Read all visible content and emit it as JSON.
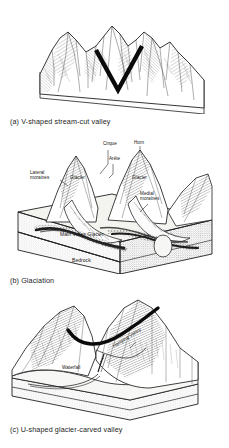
{
  "figure": {
    "background_color": "#ffffff",
    "ink_color": "#1a1a1a"
  },
  "panels": [
    {
      "id": "a",
      "caption": "(a) V-shaped stream-cut valley",
      "labels": []
    },
    {
      "id": "b",
      "caption": "(b) Glaciation",
      "labels": [
        {
          "name": "cirque",
          "text": "Cirque"
        },
        {
          "name": "horn",
          "text": "Horn"
        },
        {
          "name": "arete",
          "text": "Arête"
        },
        {
          "name": "lateral-moraines",
          "text": "Lateral moraines"
        },
        {
          "name": "glacier-left",
          "text": "Glacier"
        },
        {
          "name": "glacier-right",
          "text": "Glacier"
        },
        {
          "name": "medial-moraines",
          "text": "Medial moraines"
        },
        {
          "name": "main-valley-glacier",
          "text": "Main Valley Glacier"
        },
        {
          "name": "bedrock",
          "text": "Bedrock"
        }
      ]
    },
    {
      "id": "c",
      "caption": "(c) U-shaped glacier-carved valley",
      "labels": [
        {
          "name": "hanging-valley",
          "text": "Hanging Valley"
        },
        {
          "name": "waterfall",
          "text": "Waterfall"
        }
      ]
    }
  ],
  "label_text": {
    "cirque": "Cirque",
    "horn": "Horn",
    "arete": "Arête",
    "lateral_moraines": "Lateral\nmoraines",
    "lateral_moraines_l1": "Lateral",
    "lateral_moraines_l2": "moraines",
    "glacier_left": "Glacier",
    "glacier_right": "Glacier",
    "medial_moraines_l1": "Medial",
    "medial_moraines_l2": "moraines",
    "main_valley_glacier": "Main Valley Glacier",
    "bedrock": "Bedrock",
    "hanging_valley": "Hanging Valley",
    "waterfall": "Waterfall"
  },
  "captions": {
    "a": "(a) V-shaped stream-cut valley",
    "b": "(b) Glaciation",
    "c": "(c) U-shaped glacier-carved valley"
  }
}
